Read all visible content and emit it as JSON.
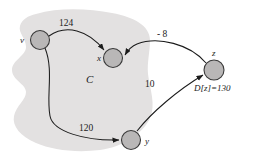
{
  "figure": {
    "background_color": "#ffffff",
    "region": {
      "label": "C",
      "fill_color": "#e3e1e1"
    },
    "nodes": [
      {
        "id": "v",
        "label": "v",
        "cx": 40,
        "cy": 40,
        "r": 9.5,
        "fill": "#b9b7b7",
        "stroke": "#3a3a3a"
      },
      {
        "id": "x",
        "label": "x",
        "cx": 113,
        "cy": 58,
        "r": 9.5,
        "fill": "#b9b7b7",
        "stroke": "#3a3a3a"
      },
      {
        "id": "y",
        "label": "y",
        "cx": 131,
        "cy": 140,
        "r": 9.5,
        "fill": "#b9b7b7",
        "stroke": "#3a3a3a"
      },
      {
        "id": "z",
        "label": "z",
        "cx": 214,
        "cy": 70,
        "r": 10,
        "fill": "#b9b7b7",
        "stroke": "#3a3a3a"
      }
    ],
    "edges": [
      {
        "id": "v-x",
        "from": "v",
        "to": "x",
        "weight": "124"
      },
      {
        "id": "v-y",
        "from": "v",
        "to": "y",
        "weight": "120"
      },
      {
        "id": "z-x",
        "from": "z",
        "to": "x",
        "weight": "- 8"
      },
      {
        "id": "y-z",
        "from": "y",
        "to": "z",
        "weight": "10"
      }
    ],
    "annotations": {
      "distance_z": "D[z]=130"
    }
  }
}
